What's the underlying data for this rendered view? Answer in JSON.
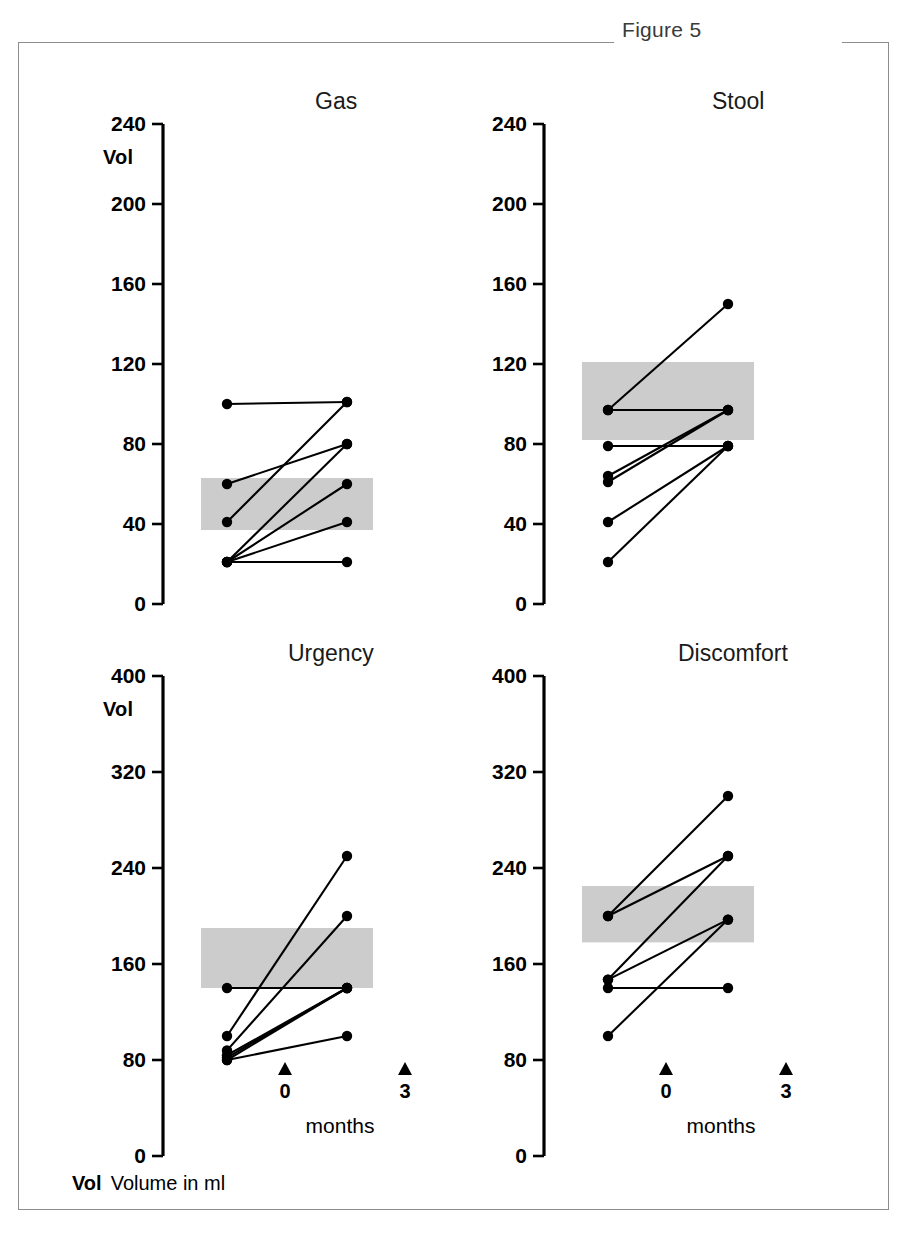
{
  "figure": {
    "number_label": "Figure 5",
    "footnote_key": "Vol",
    "footnote_text": "Volume in ml",
    "vol_axis_label": "Vol",
    "x_axis_title": "months",
    "x_tick_0": "0",
    "x_tick_3": "3",
    "shade_color": "#cccccc",
    "line_color": "#000000",
    "frame_color": "#8d8d8d"
  },
  "chart_data": [
    {
      "type": "line",
      "title": "Gas",
      "xlabel": "months",
      "ylabel": "Vol",
      "x": [
        0,
        3
      ],
      "xticklabels": [
        "0",
        "3"
      ],
      "ylim": [
        0,
        240
      ],
      "yticks": [
        0,
        40,
        80,
        120,
        160,
        200,
        240
      ],
      "yticklabels": [
        "0",
        "40",
        "80",
        "120",
        "160",
        "200",
        "240"
      ],
      "grid": false,
      "legend": "none",
      "reference_band": {
        "low": 37,
        "high": 63
      },
      "series": [
        {
          "name": "subject-1",
          "values": [
            100,
            101
          ]
        },
        {
          "name": "subject-2",
          "values": [
            60,
            80
          ]
        },
        {
          "name": "subject-3",
          "values": [
            41,
            101
          ]
        },
        {
          "name": "subject-4",
          "values": [
            21,
            80
          ]
        },
        {
          "name": "subject-5",
          "values": [
            21,
            60
          ]
        },
        {
          "name": "subject-6",
          "values": [
            21,
            41
          ]
        },
        {
          "name": "subject-7",
          "values": [
            21,
            21
          ]
        }
      ]
    },
    {
      "type": "line",
      "title": "Stool",
      "xlabel": "months",
      "ylabel": "Vol",
      "x": [
        0,
        3
      ],
      "xticklabels": [
        "0",
        "3"
      ],
      "ylim": [
        0,
        240
      ],
      "yticks": [
        0,
        40,
        80,
        120,
        160,
        200,
        240
      ],
      "yticklabels": [
        "0",
        "40",
        "80",
        "120",
        "160",
        "200",
        "240"
      ],
      "grid": false,
      "legend": "none",
      "reference_band": {
        "low": 82,
        "high": 121
      },
      "series": [
        {
          "name": "subject-1",
          "values": [
            97,
            150
          ]
        },
        {
          "name": "subject-2",
          "values": [
            97,
            97
          ]
        },
        {
          "name": "subject-3",
          "values": [
            79,
            79
          ]
        },
        {
          "name": "subject-4",
          "values": [
            64,
            97
          ]
        },
        {
          "name": "subject-5",
          "values": [
            61,
            97
          ]
        },
        {
          "name": "subject-6",
          "values": [
            41,
            79
          ]
        },
        {
          "name": "subject-7",
          "values": [
            21,
            79
          ]
        }
      ]
    },
    {
      "type": "line",
      "title": "Urgency",
      "xlabel": "months",
      "ylabel": "Vol",
      "x": [
        0,
        3
      ],
      "xticklabels": [
        "0",
        "3"
      ],
      "ylim": [
        0,
        400
      ],
      "yticks": [
        0,
        80,
        160,
        240,
        320,
        400
      ],
      "yticklabels": [
        "0",
        "80",
        "160",
        "240",
        "320",
        "400"
      ],
      "grid": false,
      "legend": "none",
      "reference_band": {
        "low": 140,
        "high": 190
      },
      "series": [
        {
          "name": "subject-1",
          "values": [
            140,
            140
          ]
        },
        {
          "name": "subject-2",
          "values": [
            100,
            250
          ]
        },
        {
          "name": "subject-3",
          "values": [
            88,
            200
          ]
        },
        {
          "name": "subject-4",
          "values": [
            84,
            140
          ]
        },
        {
          "name": "subject-5",
          "values": [
            82,
            140
          ]
        },
        {
          "name": "subject-6",
          "values": [
            80,
            140
          ]
        },
        {
          "name": "subject-7",
          "values": [
            80,
            100
          ]
        }
      ]
    },
    {
      "type": "line",
      "title": "Discomfort",
      "xlabel": "months",
      "ylabel": "Vol",
      "x": [
        0,
        3
      ],
      "xticklabels": [
        "0",
        "3"
      ],
      "ylim": [
        0,
        400
      ],
      "yticks": [
        0,
        80,
        160,
        240,
        320,
        400
      ],
      "yticklabels": [
        "0",
        "80",
        "160",
        "240",
        "320",
        "400"
      ],
      "grid": false,
      "legend": "none",
      "reference_band": {
        "low": 178,
        "high": 225
      },
      "series": [
        {
          "name": "subject-1",
          "values": [
            200,
            300
          ]
        },
        {
          "name": "subject-2",
          "values": [
            200,
            250
          ]
        },
        {
          "name": "subject-3",
          "values": [
            147,
            250
          ]
        },
        {
          "name": "subject-4",
          "values": [
            147,
            197
          ]
        },
        {
          "name": "subject-5",
          "values": [
            140,
            140
          ]
        },
        {
          "name": "subject-6",
          "values": [
            100,
            197
          ]
        }
      ]
    }
  ]
}
